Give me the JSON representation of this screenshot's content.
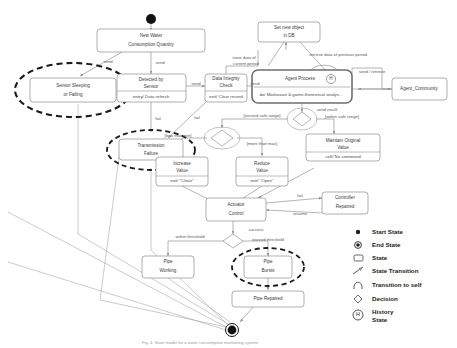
{
  "diagram": {
    "states": {
      "new_water": "New Water\nConsumption Quantity",
      "new_water_l1": "New Water",
      "new_water_l2": "Consumption Quantity",
      "sensor_fail_l1": "Sensor Sleeping",
      "sensor_fail_l2": "or Failing",
      "detected_l1": "Detected by",
      "detected_l2": "Sensor",
      "detected_act": "entry/ Data refresh",
      "integrity_l1": "Data Integrity",
      "integrity_l2": "Check",
      "integrity_act": "exit/ Clear record",
      "transmission_l1": "Transmission",
      "transmission_l2": "Failure",
      "setdb_l1": "Set new object",
      "setdb_l2": "in DB",
      "agent_title": "Agent Process",
      "agent_act": "do/ Markovian & game-theoretical analys...",
      "agent_community": "Agent_Community",
      "maintain_l1": "Maintain Original",
      "maintain_l2": "Value",
      "maintain_act": "self/ No command",
      "increase_l1": "Increase",
      "increase_l2": "Value",
      "increase_act": "exit/ \"Close\"",
      "reduce_l1": "Reduce",
      "reduce_l2": "Value",
      "reduce_act": "exit/ \"Open\"",
      "actuator_l1": "Actuator",
      "actuator_l2": "Control",
      "controller_l1": "Controller",
      "controller_l2": "Repaired",
      "pipe_working_l1": "Pipe",
      "pipe_working_l2": "Working",
      "pipe_bursts_l1": "Pipe",
      "pipe_bursts_l2": "Bursts",
      "pipe_repaired": "Pipe Repaired"
    },
    "transitions": {
      "send_1": "send",
      "send_2": "send",
      "send_3": "send",
      "send_4": "send",
      "fail_1": "fail",
      "fail_2": "fail",
      "fail_3": "fail",
      "store_current_l1": "store data of",
      "store_current_l2": "current period",
      "retrieve_prev": "retrieve data of previous period",
      "send_retrieve": "send / retrieve",
      "send_result": "send result",
      "exceed_safe": "[exceed safe range]",
      "within_safe": "[within safe range]",
      "less_than_min": "[less than min]",
      "more_than_max": "[more than max]",
      "resume": "resume",
      "success": "success",
      "within_threshold": "within threshold",
      "exceed_threshold": "exceed threshold"
    }
  },
  "legend": {
    "items": [
      {
        "icon": "start-state-icon",
        "label": "Start State"
      },
      {
        "icon": "end-state-icon",
        "label": "End State"
      },
      {
        "icon": "state-icon",
        "label": "State"
      },
      {
        "icon": "state-transition-icon",
        "label": "State Transition"
      },
      {
        "icon": "transition-to-self-icon",
        "label": "Transition to self"
      },
      {
        "icon": "decision-icon",
        "label": "Decision"
      },
      {
        "icon": "history-state-icon",
        "label": "History\nState"
      },
      {
        "icon": "history-state-icon",
        "label_l1": "History",
        "label_l2": "State"
      }
    ],
    "history_glyph": "H"
  },
  "caption": {
    "text": "Fig. 4. State model for a water consumption monitoring system"
  },
  "colors": {
    "background": "#ffffff",
    "stroke": "#8d8d8d",
    "text": "#3a3a3a",
    "highlight": "#1b1b1b"
  }
}
